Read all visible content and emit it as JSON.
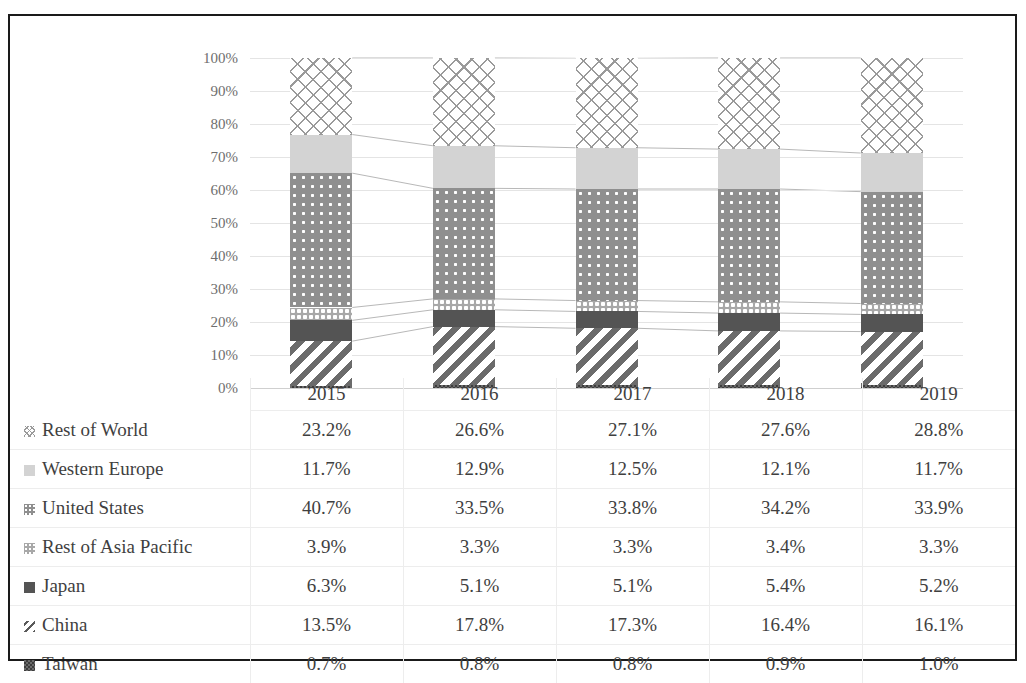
{
  "chart_data": {
    "type": "bar",
    "subtype": "stacked-100-percent-column",
    "title": "",
    "xlabel": "",
    "ylabel": "",
    "categories": [
      "2015",
      "2016",
      "2017",
      "2018",
      "2019"
    ],
    "ylim": [
      0,
      100
    ],
    "ytick_labels": [
      "0%",
      "10%",
      "20%",
      "30%",
      "40%",
      "50%",
      "60%",
      "70%",
      "80%",
      "90%",
      "100%"
    ],
    "ytick_values": [
      0,
      10,
      20,
      30,
      40,
      50,
      60,
      70,
      80,
      90,
      100
    ],
    "grid": true,
    "legend_position": "table-left-column",
    "stack_order_bottom_to_top": [
      "Taiwan",
      "China",
      "Japan",
      "Rest of Asia Pacific",
      "United States",
      "Western Europe",
      "Rest of World"
    ],
    "series": [
      {
        "name": "Rest of World",
        "pattern": "crosshatch",
        "color": "#9a9a9a",
        "values": [
          23.2,
          26.6,
          27.1,
          27.6,
          28.8
        ],
        "labels": [
          "23.2%",
          "26.6%",
          "27.1%",
          "27.6%",
          "28.8%"
        ]
      },
      {
        "name": "Western Europe",
        "pattern": "solid-light",
        "color": "#d3d3d3",
        "values": [
          11.7,
          12.9,
          12.5,
          12.1,
          11.7
        ],
        "labels": [
          "11.7%",
          "12.9%",
          "12.5%",
          "12.1%",
          "11.7%"
        ]
      },
      {
        "name": "United States",
        "pattern": "dotted-gray",
        "color": "#8f8f8f",
        "values": [
          40.7,
          33.5,
          33.8,
          34.2,
          33.9
        ],
        "labels": [
          "40.7%",
          "33.5%",
          "33.8%",
          "34.2%",
          "33.9%"
        ]
      },
      {
        "name": "Rest of Asia Pacific",
        "pattern": "speckle-light",
        "color": "#a8a8a8",
        "values": [
          3.9,
          3.3,
          3.3,
          3.4,
          3.3
        ],
        "labels": [
          "3.9%",
          "3.3%",
          "3.3%",
          "3.4%",
          "3.3%"
        ]
      },
      {
        "name": "Japan",
        "pattern": "solid-dark",
        "color": "#545454",
        "values": [
          6.3,
          5.1,
          5.1,
          5.4,
          5.2
        ],
        "labels": [
          "6.3%",
          "5.1%",
          "5.1%",
          "5.4%",
          "5.2%"
        ]
      },
      {
        "name": "China",
        "pattern": "diagonal-stripes",
        "color": "#6b6b6b",
        "values": [
          13.5,
          17.8,
          17.3,
          16.4,
          16.1
        ],
        "labels": [
          "13.5%",
          "17.8%",
          "17.3%",
          "16.4%",
          "16.1%"
        ]
      },
      {
        "name": "Taiwan",
        "pattern": "dark-checker",
        "color": "#4a4a4a",
        "values": [
          0.7,
          0.8,
          0.8,
          0.9,
          1.0
        ],
        "labels": [
          "0.7%",
          "0.8%",
          "0.8%",
          "0.9%",
          "1.0%"
        ]
      }
    ]
  },
  "table": {
    "corner_label": "",
    "column_headers": [
      "2015",
      "2016",
      "2017",
      "2018",
      "2019"
    ],
    "rows": [
      {
        "label": "Rest of World",
        "swatch": "crosshatch-swatch",
        "values": [
          "23.2%",
          "26.6%",
          "27.1%",
          "27.6%",
          "28.8%"
        ]
      },
      {
        "label": "Western Europe",
        "swatch": "light-gray-swatch",
        "values": [
          "11.7%",
          "12.9%",
          "12.5%",
          "12.1%",
          "11.7%"
        ]
      },
      {
        "label": "United States",
        "swatch": "dotted-gray-swatch",
        "values": [
          "40.7%",
          "33.5%",
          "33.8%",
          "34.2%",
          "33.9%"
        ]
      },
      {
        "label": "Rest of Asia Pacific",
        "swatch": "speckle-swatch",
        "values": [
          "3.9%",
          "3.3%",
          "3.3%",
          "3.4%",
          "3.3%"
        ]
      },
      {
        "label": "Japan",
        "swatch": "dark-gray-swatch",
        "values": [
          "6.3%",
          "5.1%",
          "5.1%",
          "5.4%",
          "5.2%"
        ]
      },
      {
        "label": "China",
        "swatch": "diagonal-swatch",
        "values": [
          "13.5%",
          "17.8%",
          "17.3%",
          "16.4%",
          "16.1%"
        ]
      },
      {
        "label": "Taiwan",
        "swatch": "checker-swatch",
        "values": [
          "0.7%",
          "0.8%",
          "0.8%",
          "0.9%",
          "1.0%"
        ]
      }
    ]
  },
  "colors": {
    "border": "#1a1a1a",
    "gridline": "#e4e4e4",
    "text": "#3f3f3f",
    "axis_text": "#6e6e6e",
    "connector": "#b8b8b8"
  }
}
